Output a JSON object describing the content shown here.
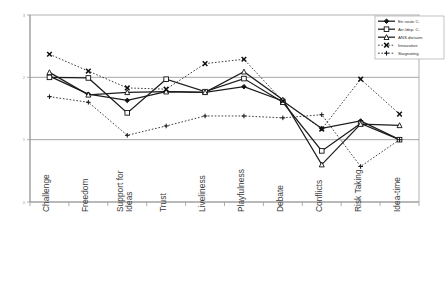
{
  "chart_data": {
    "type": "line",
    "title": "",
    "subtitle": "",
    "xlabel": "",
    "ylabel": "",
    "ylim": [
      0,
      3
    ],
    "yticks": [
      "0",
      "1",
      "2",
      "3"
    ],
    "ytick_values": [
      0,
      1,
      2,
      3
    ],
    "grid": "horizontal gridlines at 1 and 2",
    "legend_position": "top-right inside plot area",
    "categories": [
      "Challenge",
      "Freedom",
      "Support for Ideas",
      "Trust",
      "Liveliness",
      "Playfulness",
      "Debate",
      "Conflicts",
      "Risk Taking",
      "Idea-time"
    ],
    "category_lines": [
      [
        "Challenge"
      ],
      [
        "Freedom"
      ],
      [
        "Support for",
        "Ideas"
      ],
      [
        "Trust"
      ],
      [
        "Liveliness"
      ],
      [
        "Playfulness"
      ],
      [
        "Debate"
      ],
      [
        "Conflicts"
      ],
      [
        "Risk Taking"
      ],
      [
        "Idea-time"
      ]
    ],
    "series": [
      {
        "name": "En route C.",
        "marker": "diamond-filled",
        "linestyle": "solid",
        "values": [
          2.02,
          1.73,
          1.63,
          1.77,
          1.76,
          1.85,
          1.62,
          1.18,
          1.3,
          1.0
        ]
      },
      {
        "name": "Arr./dep. C.",
        "marker": "square-open",
        "linestyle": "solid",
        "values": [
          2.0,
          1.99,
          1.43,
          1.97,
          1.77,
          1.98,
          1.6,
          0.82,
          1.26,
          1.0
        ]
      },
      {
        "name": "ANS division",
        "marker": "triangle-open",
        "linestyle": "solid",
        "values": [
          2.08,
          1.72,
          1.76,
          1.77,
          1.76,
          2.09,
          1.64,
          0.6,
          1.25,
          1.23
        ]
      },
      {
        "name": "Innovative",
        "marker": "x-cross",
        "linestyle": "dotted",
        "values": [
          2.37,
          2.1,
          1.83,
          1.81,
          2.22,
          2.29,
          1.62,
          1.17,
          1.97,
          1.41
        ]
      },
      {
        "name": "Stagnating",
        "marker": "plus-cross",
        "linestyle": "dotted",
        "values": [
          1.69,
          1.6,
          1.07,
          1.22,
          1.38,
          1.38,
          1.35,
          1.4,
          0.57,
          1.0
        ]
      }
    ]
  },
  "legend": {
    "entries": [
      {
        "label": "En route C."
      },
      {
        "label": "Arr./dep. C."
      },
      {
        "label": "ANS division"
      },
      {
        "label": "Innovative"
      },
      {
        "label": "Stagnating"
      }
    ]
  },
  "axis": {
    "y_tick_labels": [
      "3",
      "2",
      "1",
      "0"
    ]
  }
}
